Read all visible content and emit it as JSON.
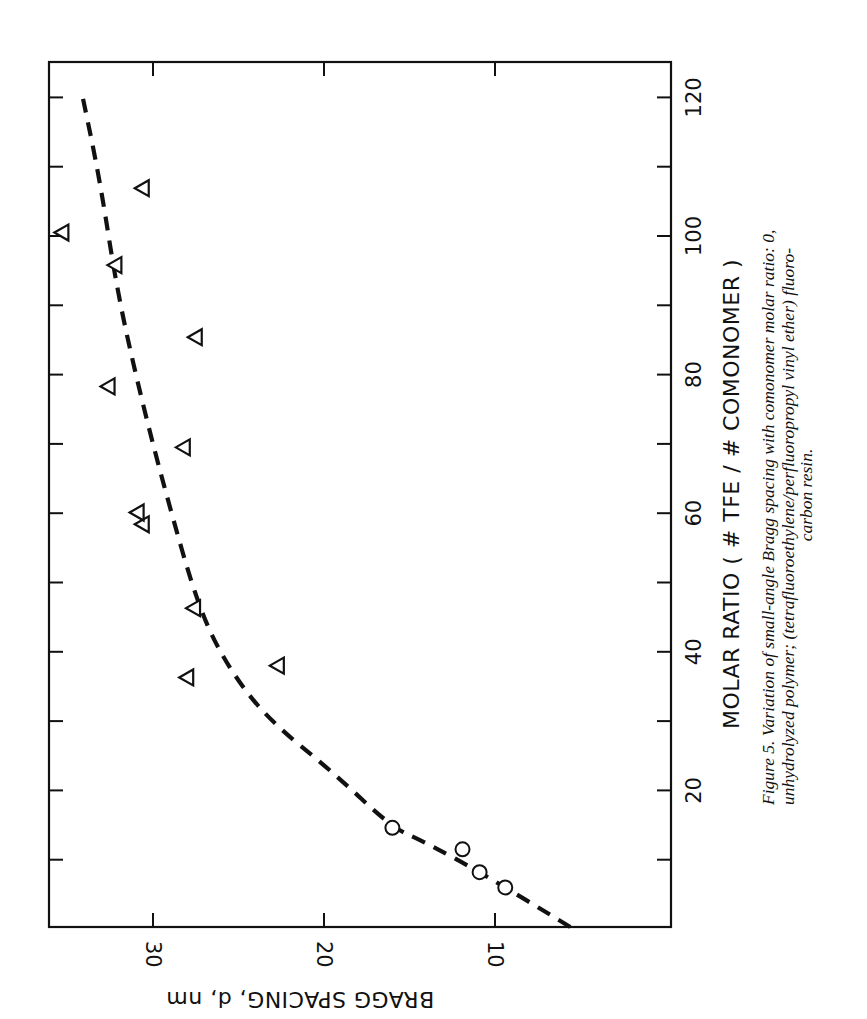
{
  "figure": {
    "caption_lines": [
      "Figure 5. Variation of small-angle Bragg spacing with comonomer molar ratio: 0,",
      "unhydrolyzed polymer; (tetrafluoroethylene/perfluoropropyl vinyl ether) fluoro-",
      "carbon resin."
    ],
    "orientation": "rotated 90° (page landscape)"
  },
  "chart_data": {
    "type": "scatter",
    "title": "",
    "xlabel": "MOLAR RATIO   ( # TFE / # COMONOMER )",
    "ylabel": "BRAGG SPACING, d, nm",
    "xlim": [
      0,
      125
    ],
    "ylim": [
      0,
      36
    ],
    "x_ticks": [
      20,
      40,
      60,
      80,
      100,
      120
    ],
    "x_minor_ticks": [
      10,
      30,
      50,
      70,
      90,
      110
    ],
    "y_ticks": [
      10,
      20,
      30
    ],
    "grid": false,
    "legend": null,
    "series": [
      {
        "name": "unhydrolyzed polymer",
        "marker": "circle",
        "points": [
          {
            "x": 6.0,
            "y": 9.4
          },
          {
            "x": 8.2,
            "y": 10.9
          },
          {
            "x": 11.5,
            "y": 11.9
          },
          {
            "x": 14.6,
            "y": 16.0
          }
        ]
      },
      {
        "name": "TFE/PPVE fluorocarbon resin",
        "marker": "triangle",
        "points": [
          {
            "x": 36.3,
            "y": 28.0
          },
          {
            "x": 38.0,
            "y": 22.7
          },
          {
            "x": 46.3,
            "y": 27.6
          },
          {
            "x": 58.4,
            "y": 30.6
          },
          {
            "x": 60.1,
            "y": 30.9
          },
          {
            "x": 69.5,
            "y": 28.2
          },
          {
            "x": 78.3,
            "y": 32.6
          },
          {
            "x": 85.4,
            "y": 27.5
          },
          {
            "x": 95.8,
            "y": 32.2
          },
          {
            "x": 100.5,
            "y": 35.3
          },
          {
            "x": 106.9,
            "y": 30.6
          }
        ]
      },
      {
        "name": "fit curve",
        "style": "dashed",
        "points": [
          {
            "x": 0.3,
            "y": 5.6
          },
          {
            "x": 8.1,
            "y": 10.8
          },
          {
            "x": 12.8,
            "y": 14.3
          },
          {
            "x": 14.6,
            "y": 16.0
          },
          {
            "x": 22.9,
            "y": 19.6
          },
          {
            "x": 30.1,
            "y": 23.2
          },
          {
            "x": 37.3,
            "y": 25.5
          },
          {
            "x": 46.0,
            "y": 27.3
          },
          {
            "x": 63.3,
            "y": 29.3
          },
          {
            "x": 77.7,
            "y": 30.8
          },
          {
            "x": 92.1,
            "y": 32.1
          },
          {
            "x": 108.0,
            "y": 33.1
          },
          {
            "x": 121.1,
            "y": 34.2
          }
        ]
      }
    ]
  }
}
